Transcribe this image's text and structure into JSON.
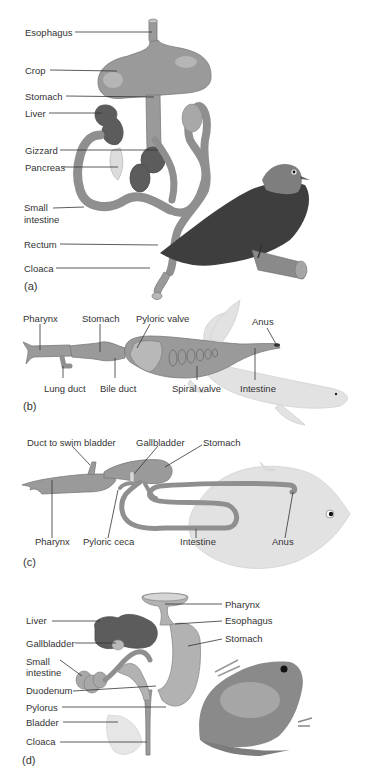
{
  "figure": {
    "panels": [
      {
        "id": "a",
        "letter": "(a)",
        "animal": "bird (pigeon)",
        "labels": [
          "Esophagus",
          "Crop",
          "Stomach",
          "Liver",
          "Gizzard",
          "Pancreas",
          "Small intestine",
          "Rectum",
          "Cloaca"
        ]
      },
      {
        "id": "b",
        "letter": "(b)",
        "animal": "lungfish",
        "labels": [
          "Pharynx",
          "Stomach",
          "Pyloric valve",
          "Anus",
          "Lung duct",
          "Bile duct",
          "Spiral valve",
          "Intestine"
        ]
      },
      {
        "id": "c",
        "letter": "(c)",
        "animal": "bony fish",
        "labels": [
          "Duct to swim bladder",
          "Gallbladder",
          "Stomach",
          "Pharynx",
          "Pyloric ceca",
          "Intestine",
          "Anus"
        ]
      },
      {
        "id": "d",
        "letter": "(d)",
        "animal": "frog",
        "labels": [
          "Liver",
          "Gallbladder",
          "Small intestine",
          "Duodenum",
          "Pylorus",
          "Bladder",
          "Cloaca",
          "Pharynx",
          "Esophagus",
          "Stomach"
        ]
      }
    ]
  },
  "a": {
    "esophagus": "Esophagus",
    "crop": "Crop",
    "stomach": "Stomach",
    "liver": "Liver",
    "gizzard": "Gizzard",
    "pancreas": "Pancreas",
    "small_intestine_1": "Small",
    "small_intestine_2": "intestine",
    "rectum": "Rectum",
    "cloaca": "Cloaca",
    "letter": "(a)"
  },
  "b": {
    "pharynx": "Pharynx",
    "stomach": "Stomach",
    "pyloric_valve": "Pyloric valve",
    "anus": "Anus",
    "lung_duct": "Lung duct",
    "bile_duct": "Bile duct",
    "spiral_valve": "Spiral valve",
    "intestine": "Intestine",
    "letter": "(b)"
  },
  "c": {
    "duct_swim_bladder": "Duct to swim bladder",
    "gallbladder": "Gallbladder",
    "stomach": "Stomach",
    "pharynx": "Pharynx",
    "pyloric_ceca": "Pyloric ceca",
    "intestine": "Intestine",
    "anus": "Anus",
    "letter": "(c)"
  },
  "d": {
    "liver": "Liver",
    "gallbladder": "Gallbladder",
    "small_intestine_1": "Small",
    "small_intestine_2": "intestine",
    "duodenum": "Duodenum",
    "pylorus": "Pylorus",
    "bladder": "Bladder",
    "cloaca": "Cloaca",
    "pharynx": "Pharynx",
    "esophagus": "Esophagus",
    "stomach": "Stomach",
    "letter": "(d)"
  }
}
